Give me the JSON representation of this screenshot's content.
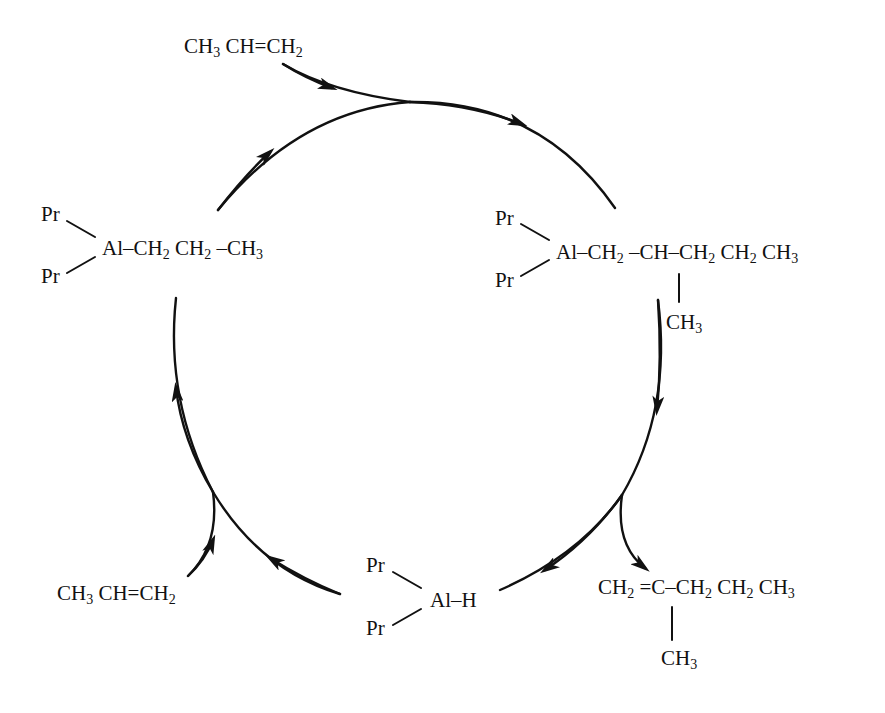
{
  "diagram": {
    "type": "catalytic-cycle",
    "nodes": [
      {
        "id": "propene-top",
        "role": "feed",
        "formula_parts": [
          "CH",
          "3",
          "CH=CH",
          "2"
        ]
      },
      {
        "id": "tripropylaluminum",
        "role": "cycle-intermediate",
        "ligands": [
          "Pr",
          "Pr"
        ],
        "chain_parts": [
          "Al–CH",
          "2",
          " CH",
          "2",
          " –CH",
          "3"
        ]
      },
      {
        "id": "insertion-product",
        "role": "cycle-intermediate",
        "ligands": [
          "Pr",
          "Pr"
        ],
        "chain_parts": [
          "Al–CH",
          "2",
          " –CH–CH",
          "2",
          " CH",
          "2",
          " CH",
          "3"
        ],
        "branch_parts": [
          "CH",
          "3"
        ]
      },
      {
        "id": "dimer-product",
        "role": "product",
        "chain_parts": [
          "CH",
          "2",
          " =C–CH",
          "2",
          " CH",
          "2",
          " CH",
          "3"
        ],
        "branch_parts": [
          "CH",
          "3"
        ]
      },
      {
        "id": "dipropylaluminum-hydride",
        "role": "cycle-intermediate",
        "ligands": [
          "Pr",
          "Pr"
        ],
        "chain_parts": [
          "Al–H"
        ]
      },
      {
        "id": "propene-bottom",
        "role": "feed",
        "formula_parts": [
          "CH",
          "3",
          "CH=CH",
          "2"
        ]
      }
    ],
    "edges": [
      {
        "from": "tripropylaluminum",
        "to": "insertion-product",
        "via": "propene-top",
        "direction": "clockwise"
      },
      {
        "from": "insertion-product",
        "to": "dipropylaluminum-hydride",
        "releases": "dimer-product"
      },
      {
        "from": "dipropylaluminum-hydride",
        "to": "tripropylaluminum",
        "via": "propene-bottom"
      }
    ],
    "colors": {
      "ink": "#111111",
      "background": "#ffffff"
    }
  }
}
